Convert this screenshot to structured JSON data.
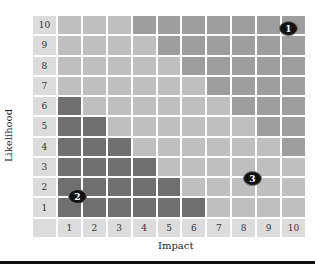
{
  "chart_data": {
    "type": "heatmap",
    "title": "",
    "xlabel": "Impact",
    "ylabel": "Likelihood",
    "x_ticks": [
      "1",
      "2",
      "3",
      "4",
      "5",
      "6",
      "7",
      "8",
      "9",
      "10"
    ],
    "y_ticks": [
      "10",
      "9",
      "8",
      "7",
      "6",
      "5",
      "4",
      "3",
      "2",
      "1"
    ],
    "legend_levels": {
      "D": "dark (low-risk zone)",
      "L": "light (medium zone)",
      "M": "medium-dark (high-risk zone)"
    },
    "colors": {
      "label": "#dcdcdc",
      "L": "#bfbfbf",
      "M": "#9e9e9e",
      "D": "#6f6f6f",
      "marker": "#111111"
    },
    "rows": [
      {
        "likelihood": "10",
        "cells": [
          "L",
          "L",
          "L",
          "M",
          "M",
          "M",
          "M",
          "M",
          "M",
          "M"
        ]
      },
      {
        "likelihood": "9",
        "cells": [
          "L",
          "L",
          "L",
          "L",
          "M",
          "M",
          "M",
          "M",
          "M",
          "M"
        ]
      },
      {
        "likelihood": "8",
        "cells": [
          "L",
          "L",
          "L",
          "L",
          "L",
          "M",
          "M",
          "M",
          "M",
          "M"
        ]
      },
      {
        "likelihood": "7",
        "cells": [
          "L",
          "L",
          "L",
          "L",
          "L",
          "L",
          "M",
          "M",
          "M",
          "M"
        ]
      },
      {
        "likelihood": "6",
        "cells": [
          "D",
          "L",
          "L",
          "L",
          "L",
          "L",
          "L",
          "M",
          "M",
          "M"
        ]
      },
      {
        "likelihood": "5",
        "cells": [
          "D",
          "D",
          "L",
          "L",
          "L",
          "L",
          "L",
          "L",
          "M",
          "M"
        ]
      },
      {
        "likelihood": "4",
        "cells": [
          "D",
          "D",
          "D",
          "L",
          "L",
          "L",
          "L",
          "L",
          "L",
          "M"
        ]
      },
      {
        "likelihood": "3",
        "cells": [
          "D",
          "D",
          "D",
          "D",
          "L",
          "L",
          "L",
          "L",
          "L",
          "L"
        ]
      },
      {
        "likelihood": "2",
        "cells": [
          "D",
          "D",
          "D",
          "D",
          "D",
          "L",
          "L",
          "L",
          "L",
          "L"
        ]
      },
      {
        "likelihood": "1",
        "cells": [
          "D",
          "D",
          "D",
          "D",
          "D",
          "D",
          "L",
          "L",
          "L",
          "L"
        ]
      }
    ],
    "markers": [
      {
        "label": "1",
        "impact": 10,
        "likelihood": 10,
        "left": 279,
        "top": 21
      },
      {
        "label": "2",
        "impact": 1.5,
        "likelihood": 1.5,
        "left": 68,
        "top": 189
      },
      {
        "label": "3",
        "impact": 8.5,
        "likelihood": 2.5,
        "left": 243,
        "top": 171
      }
    ]
  }
}
